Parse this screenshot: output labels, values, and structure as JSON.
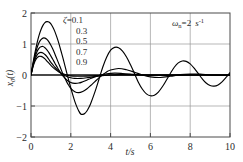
{
  "chart_data": {
    "type": "line",
    "title": "",
    "xlabel": "t/s",
    "ylabel": "x0(t)",
    "xlim": [
      0,
      10
    ],
    "ylim": [
      -2,
      2
    ],
    "xticks": [
      0,
      2,
      4,
      6,
      8,
      10
    ],
    "yticks": [
      -2,
      -1,
      0,
      1,
      2
    ],
    "grid": true,
    "legend_position": "upper-left-inside",
    "annotations": [
      {
        "text": "ωn=2 s⁻¹",
        "symbol": "ω",
        "subscript": "n",
        "value": "=2",
        "unit": "s",
        "unit_exponent": "-1",
        "position": "upper-right-inside"
      }
    ],
    "legend_title": "ζ=",
    "series": [
      {
        "name": "0.1",
        "damping_ratio": 0.1,
        "color": "#000000",
        "x": [
          0,
          0.1,
          0.2,
          0.3,
          0.4,
          0.5,
          0.6,
          0.7,
          0.8,
          0.9,
          1.0,
          1.1,
          1.2,
          1.3,
          1.4,
          1.5,
          1.6,
          1.7,
          1.8,
          1.9,
          2.0,
          2.1,
          2.2,
          2.3,
          2.4,
          2.5,
          2.6,
          2.7,
          2.8,
          2.9,
          3.0,
          3.2,
          3.4,
          3.6,
          3.8,
          4.0,
          4.2,
          4.4,
          4.6,
          4.8,
          5.0,
          5.2,
          5.4,
          5.6,
          5.8,
          6.0,
          6.2,
          6.4,
          6.6,
          6.8,
          7.0,
          7.2,
          7.4,
          7.6,
          7.8,
          8.0,
          8.2,
          8.4,
          8.6,
          8.8,
          9.0,
          9.2,
          9.4,
          9.6,
          9.8,
          10.0
        ],
        "y": [
          0,
          0.38,
          0.72,
          1.02,
          1.27,
          1.46,
          1.6,
          1.69,
          1.72,
          1.71,
          1.65,
          1.54,
          1.4,
          1.22,
          1.02,
          0.79,
          0.56,
          0.31,
          0.06,
          -0.18,
          -0.42,
          -0.64,
          -0.85,
          -1.02,
          -1.16,
          -1.26,
          -1.27,
          -1.24,
          -1.17,
          -1.06,
          -0.92,
          -0.57,
          -0.17,
          0.24,
          0.57,
          0.8,
          0.89,
          0.88,
          0.77,
          0.58,
          0.33,
          0.05,
          -0.24,
          -0.46,
          -0.61,
          -0.67,
          -0.65,
          -0.55,
          -0.38,
          -0.17,
          0.05,
          0.25,
          0.39,
          0.45,
          0.44,
          0.36,
          0.22,
          0.05,
          -0.12,
          -0.26,
          -0.34,
          -0.36,
          -0.32,
          -0.22,
          -0.08,
          0.08
        ]
      },
      {
        "name": "0.3",
        "damping_ratio": 0.3,
        "color": "#000000",
        "x": [
          0,
          0.1,
          0.2,
          0.3,
          0.4,
          0.5,
          0.6,
          0.7,
          0.8,
          0.9,
          1.0,
          1.1,
          1.2,
          1.3,
          1.4,
          1.5,
          1.6,
          1.7,
          1.8,
          1.9,
          2.0,
          2.2,
          2.4,
          2.6,
          2.8,
          3.0,
          3.2,
          3.4,
          3.6,
          3.8,
          4.0,
          4.4,
          4.8,
          5.2,
          5.6,
          6.0,
          6.5,
          7.0,
          7.5,
          8.0,
          8.5,
          9.0,
          9.5,
          10.0
        ],
        "y": [
          0,
          0.35,
          0.64,
          0.87,
          1.04,
          1.14,
          1.19,
          1.19,
          1.15,
          1.07,
          0.96,
          0.83,
          0.68,
          0.52,
          0.36,
          0.2,
          0.04,
          -0.1,
          -0.23,
          -0.34,
          -0.43,
          -0.54,
          -0.57,
          -0.53,
          -0.45,
          -0.34,
          -0.22,
          -0.1,
          0.01,
          0.1,
          0.16,
          0.21,
          0.17,
          0.09,
          0.0,
          -0.06,
          -0.08,
          -0.04,
          0.01,
          0.03,
          0.03,
          0.0,
          -0.01,
          -0.01
        ]
      },
      {
        "name": "0.5",
        "damping_ratio": 0.5,
        "color": "#000000",
        "x": [
          0,
          0.1,
          0.2,
          0.3,
          0.4,
          0.5,
          0.6,
          0.7,
          0.8,
          0.9,
          1.0,
          1.1,
          1.2,
          1.3,
          1.4,
          1.5,
          1.6,
          1.8,
          2.0,
          2.2,
          2.4,
          2.6,
          2.8,
          3.0,
          3.2,
          3.5,
          3.8,
          4.2,
          4.6,
          5.0,
          5.5,
          6.0,
          6.5,
          7.0,
          8.0,
          9.0,
          10.0
        ],
        "y": [
          0,
          0.32,
          0.57,
          0.75,
          0.86,
          0.91,
          0.92,
          0.88,
          0.81,
          0.72,
          0.61,
          0.5,
          0.38,
          0.27,
          0.16,
          0.06,
          -0.03,
          -0.16,
          -0.24,
          -0.27,
          -0.26,
          -0.22,
          -0.17,
          -0.11,
          -0.06,
          0.0,
          0.04,
          0.06,
          0.05,
          0.03,
          0.0,
          -0.01,
          -0.01,
          -0.01,
          0.0,
          0.0,
          0.0
        ]
      },
      {
        "name": "0.7",
        "damping_ratio": 0.7,
        "color": "#000000",
        "x": [
          0,
          0.1,
          0.2,
          0.3,
          0.4,
          0.5,
          0.6,
          0.7,
          0.8,
          0.9,
          1.0,
          1.1,
          1.2,
          1.4,
          1.6,
          1.8,
          2.0,
          2.2,
          2.5,
          2.8,
          3.1,
          3.5,
          4.0,
          4.5,
          5.0,
          6.0,
          7.0,
          8.0,
          9.0,
          10.0
        ],
        "y": [
          0,
          0.29,
          0.5,
          0.64,
          0.71,
          0.73,
          0.71,
          0.66,
          0.59,
          0.5,
          0.41,
          0.33,
          0.25,
          0.12,
          0.02,
          -0.05,
          -0.09,
          -0.11,
          -0.11,
          -0.09,
          -0.06,
          -0.03,
          0.0,
          0.01,
          0.01,
          0.0,
          0.0,
          0.0,
          0.0,
          0.0
        ]
      },
      {
        "name": "0.9",
        "damping_ratio": 0.9,
        "color": "#000000",
        "x": [
          0,
          0.1,
          0.2,
          0.3,
          0.4,
          0.5,
          0.6,
          0.7,
          0.8,
          0.9,
          1.0,
          1.2,
          1.4,
          1.6,
          1.8,
          2.0,
          2.3,
          2.6,
          3.0,
          3.5,
          4.0,
          5.0,
          6.0,
          7.0,
          8.0,
          9.0,
          10.0
        ],
        "y": [
          0,
          0.26,
          0.44,
          0.55,
          0.6,
          0.6,
          0.57,
          0.52,
          0.45,
          0.38,
          0.31,
          0.19,
          0.1,
          0.04,
          0.0,
          -0.03,
          -0.04,
          -0.04,
          -0.03,
          -0.01,
          0.0,
          0.0,
          0.0,
          0.0,
          0.0,
          0.0,
          0.0
        ]
      }
    ]
  },
  "axes": {
    "x_tick_labels": [
      "0",
      "2",
      "4",
      "6",
      "8",
      "10"
    ],
    "y_tick_labels": [
      "-2",
      "-1",
      "0",
      "1",
      "2"
    ],
    "x_axis_title": "t/s",
    "y_axis_title_base": "x",
    "y_axis_title_sub": "0",
    "y_axis_title_tail": "(t)"
  },
  "legend": {
    "symbol": "ζ",
    "equals": "=",
    "entries": [
      "0.1",
      "0.3",
      "0.5",
      "0.7",
      "0.9"
    ]
  },
  "annotation": {
    "omega": "ω",
    "omega_sub": "n",
    "equals_value": "=2",
    "unit": "s",
    "unit_exp": "-1"
  },
  "style": {
    "axis_color": "#4a4a4a",
    "grid_color": "#9a9a9a",
    "curve_color": "#000000",
    "zero_line_color": "#1a1a1a",
    "background": "#ffffff"
  }
}
